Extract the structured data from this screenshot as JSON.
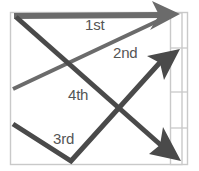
{
  "diagram": {
    "type": "stroke-order-arrow-diagram",
    "frame": {
      "x": 10,
      "y": 12,
      "width": 178,
      "height": 153,
      "border_color": "#c9c9c9",
      "fill_color": "#ffffff"
    },
    "side_strip": {
      "name": "right-segmented-strip",
      "x": 170,
      "y": 13,
      "width": 12,
      "height": 152,
      "border_color": "#c9c9c9",
      "divider_y": [
        48,
        92,
        128
      ],
      "segments": 4
    },
    "stroke_color_dark": "#4a4a4a",
    "stroke_color_mid": "#6b6b6b",
    "label_color": "#555555",
    "strokes": [
      {
        "label": "1st",
        "order": 1,
        "name": "stroke-1st",
        "description": "horizontal sweep left to right across the top",
        "color": "#6b6b6b",
        "width": 6,
        "points": [
          [
            14,
            16
          ],
          [
            166,
            15
          ]
        ],
        "arrow_tip": [
          180,
          14
        ],
        "arrow_direction": "right",
        "label_position": [
          85,
          17
        ]
      },
      {
        "label": "2nd",
        "order": 2,
        "name": "stroke-2nd",
        "description": "rising diagonal from mid-left edge up to the top right",
        "color": "#6b6b6b",
        "width": 4,
        "points": [
          [
            13,
            89
          ],
          [
            163,
            18
          ]
        ],
        "arrow_tip": [
          180,
          14
        ],
        "arrow_direction": "up-right",
        "label_position": [
          113,
          45
        ]
      },
      {
        "label": "3rd",
        "order": 3,
        "name": "stroke-3rd",
        "description": "V shape descending from lower-left to the bottom then rising to the middle-right",
        "color": "#4a4a4a",
        "width": 5,
        "points": [
          [
            13,
            124
          ],
          [
            71,
            161
          ],
          [
            163,
            58
          ]
        ],
        "arrow_tip": [
          179,
          50
        ],
        "arrow_direction": "up-right",
        "label_position": [
          53,
          131
        ]
      },
      {
        "label": "4th",
        "order": 4,
        "name": "stroke-4th",
        "description": "long diagonal from the top-left corner down to the bottom right",
        "color": "#4a4a4a",
        "width": 5,
        "points": [
          [
            16,
            17
          ],
          [
            162,
            146
          ]
        ],
        "arrow_tip": [
          180,
          160
        ],
        "arrow_direction": "down-right",
        "label_position": [
          68,
          87
        ]
      }
    ],
    "crossings": [
      [
        62,
        66
      ],
      [
        124,
        113
      ]
    ]
  }
}
